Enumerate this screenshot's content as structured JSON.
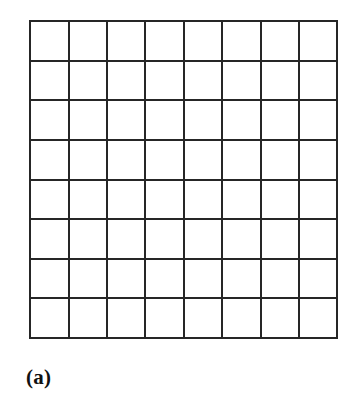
{
  "figure": {
    "caption": "(a)",
    "caption_style": "bold-serif",
    "background_color": "#ffffff",
    "line_color": "#262626",
    "cell_fill_color": "#ffffff",
    "width_px": 357,
    "height_px": 411
  },
  "chart_data": {
    "type": "table",
    "title": "(a)",
    "subtitle": "",
    "xlabel": "",
    "ylabel": "",
    "rows": 8,
    "columns": 8,
    "total_cells": 64,
    "cell_width_px": 38.4,
    "cell_height_px": 39.6,
    "grid_left_px": 30,
    "grid_top_px": 21,
    "grid_right_px": 337,
    "grid_bottom_px": 338,
    "grid": [
      [
        "",
        "",
        "",
        "",
        "",
        "",
        "",
        ""
      ],
      [
        "",
        "",
        "",
        "",
        "",
        "",
        "",
        ""
      ],
      [
        "",
        "",
        "",
        "",
        "",
        "",
        "",
        ""
      ],
      [
        "",
        "",
        "",
        "",
        "",
        "",
        "",
        ""
      ],
      [
        "",
        "",
        "",
        "",
        "",
        "",
        "",
        ""
      ],
      [
        "",
        "",
        "",
        "",
        "",
        "",
        "",
        ""
      ],
      [
        "",
        "",
        "",
        "",
        "",
        "",
        "",
        ""
      ],
      [
        "",
        "",
        "",
        "",
        "",
        "",
        "",
        ""
      ]
    ],
    "vertical_line_x": [
      1.2,
      39.6,
      78.0,
      116.4,
      154.8,
      193.2,
      231.6,
      270.0,
      307.8
    ],
    "horizontal_line_y": [
      1.2,
      40.8,
      80.4,
      120.0,
      159.6,
      199.2,
      238.8,
      278.4,
      317.8
    ],
    "grid_visible": true,
    "legend": [],
    "legend_position": "none",
    "annotations": [
      {
        "text": "(a)",
        "x_px": 26,
        "y_px": 364,
        "role": "subfigure-label"
      }
    ]
  }
}
